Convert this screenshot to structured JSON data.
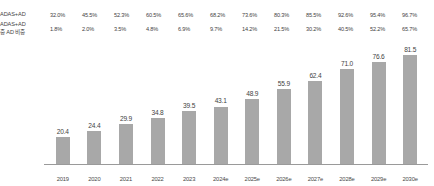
{
  "chart_data": {
    "type": "bar",
    "title": "",
    "xlabel": "",
    "ylabel": "",
    "ylim": [
      0,
      90
    ],
    "grid": false,
    "legend": "none",
    "categories": [
      "2019",
      "2020",
      "2021",
      "2022",
      "2023",
      "2024e",
      "2025e",
      "2026e",
      "2027e",
      "2028e",
      "2029e",
      "2030e"
    ],
    "values": [
      20.4,
      24.4,
      29.9,
      34.8,
      39.5,
      43.1,
      48.9,
      55.9,
      62.4,
      71.0,
      76.6,
      81.5
    ],
    "value_labels": [
      "20.4",
      "24.4",
      "29.9",
      "34.8",
      "39.5",
      "43.1",
      "48.9",
      "55.9",
      "62.4",
      "71.0",
      "76.6",
      "81.5"
    ],
    "bar_color": "#a8a8a8",
    "table_rows": [
      {
        "label_lines": [
          "ADAS+AD"
        ],
        "values": [
          "32.0%",
          "45.5%",
          "52.3%",
          "60.5%",
          "65.6%",
          "68.2%",
          "73.6%",
          "80.3%",
          "85.5%",
          "92.6%",
          "95.4%",
          "96.7%"
        ]
      },
      {
        "label_lines": [
          "ADAS+AD",
          "중 AD 비중"
        ],
        "values": [
          "1.8%",
          "2.0%",
          "3.5%",
          "4.8%",
          "6.9%",
          "9.7%",
          "14.2%",
          "21.5%",
          "30.2%",
          "40.5%",
          "52.2%",
          "65.7%"
        ]
      }
    ]
  }
}
